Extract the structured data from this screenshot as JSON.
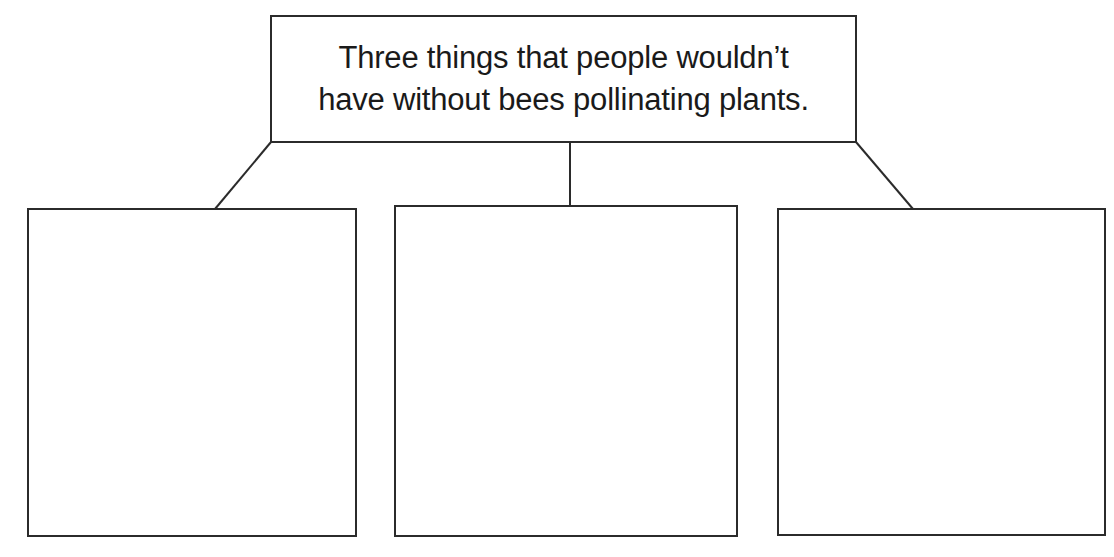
{
  "diagram": {
    "title": {
      "lines": [
        "Three things that people wouldn’t",
        "have without bees pollinating plants."
      ]
    },
    "answer_boxes": [
      {
        "label": "",
        "content": ""
      },
      {
        "label": "",
        "content": ""
      },
      {
        "label": "",
        "content": ""
      }
    ],
    "colors": {
      "line": "#2b2b2b",
      "text": "#1a1a1a",
      "background": "#ffffff"
    }
  }
}
